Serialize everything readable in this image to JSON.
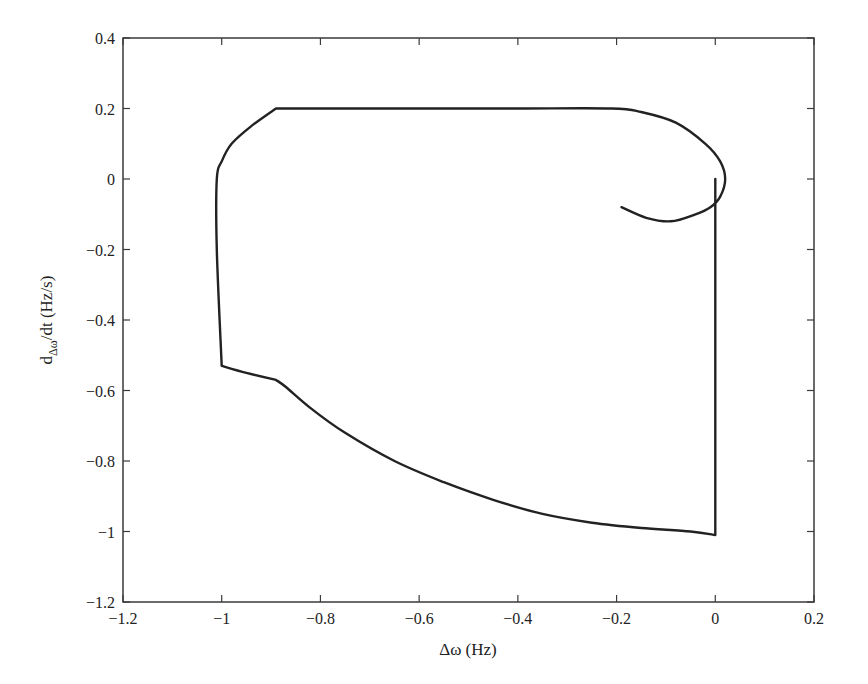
{
  "chart_data": {
    "type": "line",
    "title": "",
    "xlabel": "Δω (Hz)",
    "ylabel": "dΔω/dt (Hz/s)",
    "ylabel_parts": {
      "main": "d",
      "subscript": "Δω",
      "rest": "/dt (Hz/s)"
    },
    "xlim": [
      -1.2,
      0.2
    ],
    "ylim": [
      -1.2,
      0.4
    ],
    "xticks": [
      -1.2,
      -1,
      -0.8,
      -0.6,
      -0.4,
      -0.2,
      0,
      0.2
    ],
    "xtick_labels": [
      "−1.2",
      "−1",
      "−0.8",
      "−0.6",
      "−0.4",
      "−0.2",
      "0",
      "0.2"
    ],
    "yticks": [
      0.4,
      0.2,
      0,
      -0.2,
      -0.4,
      -0.6,
      -0.8,
      -1,
      -1.2
    ],
    "ytick_labels": [
      "0.4",
      "0.2",
      "0",
      "−0.2",
      "−0.4",
      "−0.6",
      "−0.8",
      "−1",
      "−1.2"
    ],
    "grid": false,
    "legend": null,
    "series": [
      {
        "name": "phase trajectory",
        "color": "#222222",
        "x": [
          0.0,
          0.0,
          -0.05,
          -0.15,
          -0.25,
          -0.35,
          -0.45,
          -0.55,
          -0.65,
          -0.75,
          -0.82,
          -0.87,
          -0.89,
          -0.95,
          -1.0,
          -1.01,
          -1.01,
          -1.0,
          -0.98,
          -0.94,
          -0.89,
          -0.6,
          -0.4,
          -0.21,
          -0.15,
          -0.08,
          -0.02,
          0.01,
          0.02,
          0.01,
          -0.01,
          -0.04,
          -0.09,
          -0.14,
          -0.19
        ],
        "y": [
          0.0,
          -1.01,
          -1.0,
          -0.99,
          -0.975,
          -0.95,
          -0.91,
          -0.86,
          -0.8,
          -0.72,
          -0.65,
          -0.59,
          -0.57,
          -0.55,
          -0.53,
          -0.2,
          0.0,
          0.05,
          0.1,
          0.15,
          0.2,
          0.2,
          0.2,
          0.2,
          0.19,
          0.16,
          0.1,
          0.05,
          0.0,
          -0.05,
          -0.08,
          -0.1,
          -0.12,
          -0.11,
          -0.08
        ]
      }
    ]
  }
}
